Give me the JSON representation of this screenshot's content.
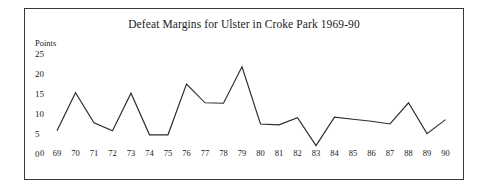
{
  "chart_data": {
    "type": "line",
    "title": "Defeat Margins for Ulster in Croke Park 1969-90",
    "xlabel": "",
    "ylabel": "Points",
    "ylim": [
      0,
      25
    ],
    "yticks": [
      25,
      20,
      15,
      10,
      5,
      0
    ],
    "grid": false,
    "legend": null,
    "origin_label": "0",
    "categories": [
      "69",
      "70",
      "71",
      "72",
      "73",
      "74",
      "75",
      "76",
      "77",
      "78",
      "79",
      "80",
      "81",
      "82",
      "83",
      "84",
      "85",
      "86",
      "87",
      "88",
      "89",
      "90"
    ],
    "x": [
      1969,
      1970,
      1971,
      1972,
      1973,
      1974,
      1975,
      1976,
      1977,
      1978,
      1979,
      1980,
      1981,
      1982,
      1983,
      1984,
      1985,
      1986,
      1987,
      1988,
      1989,
      1990
    ],
    "values": [
      5.8,
      15.3,
      7.8,
      5.8,
      15.2,
      4.8,
      4.8,
      17.5,
      12.8,
      12.7,
      21.8,
      7.5,
      7.3,
      9.1,
      2.1,
      9.2,
      8.7,
      8.2,
      7.5,
      12.8,
      5.1,
      8.6
    ],
    "series": [
      {
        "name": "Defeat margin",
        "values": [
          5.8,
          15.3,
          7.8,
          5.8,
          15.2,
          4.8,
          4.8,
          17.5,
          12.8,
          12.7,
          21.8,
          7.5,
          7.3,
          9.1,
          2.1,
          9.2,
          8.7,
          8.2,
          7.5,
          12.8,
          5.1,
          8.6
        ],
        "color": "#2b2b2b"
      }
    ],
    "colors": {
      "line": "#2b2b2b",
      "border": "#3a3a3a",
      "background": "#ffffff",
      "text": "#1a1a1a"
    }
  }
}
